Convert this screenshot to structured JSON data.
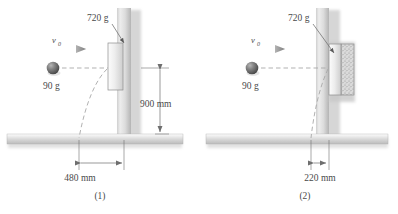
{
  "figure": {
    "panels": [
      {
        "id": "panel-1",
        "caption": "(1)",
        "velocity_label": "v",
        "velocity_subscript": "0",
        "ball_mass": "90 g",
        "block_mass": "720 g",
        "vertical_dimension": "900 mm",
        "horizontal_dimension": "480 mm"
      },
      {
        "id": "panel-2",
        "caption": "(2)",
        "velocity_label": "v",
        "velocity_subscript": "0",
        "ball_mass": "90 g",
        "block_mass": "720 g",
        "horizontal_dimension": "220 mm"
      }
    ],
    "colors": {
      "ink": "#4a4a4a",
      "line": "#6e6e6e",
      "ground_light": "#f2f2f2",
      "ground_dark": "#b9b9b9",
      "wall_light": "#ececec",
      "wall_dark": "#b5b5b5",
      "block_light": "#fbfbfb",
      "block_dark": "#cfcfcf",
      "ball_light": "#9a9a9a",
      "ball_dark": "#4d4d4d",
      "pad_fill": "#d8d8d8",
      "dashed": "#a8a8a8"
    }
  }
}
